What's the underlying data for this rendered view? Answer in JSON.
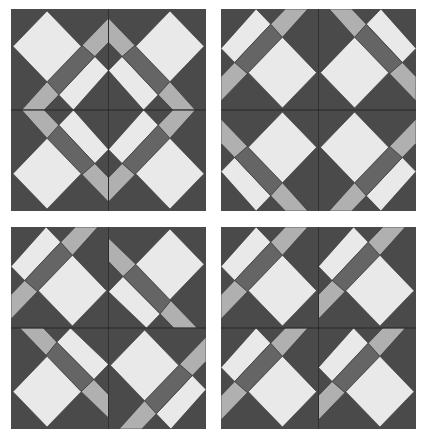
{
  "figure": {
    "colors": {
      "background_dark": "#4a4a4a",
      "stripe_dark": "#656565",
      "medium_gray": "#b0b0b0",
      "light": "#e9e9e9",
      "seam_line": "#1e1e1e"
    },
    "block_shapes": {
      "light_strip": "36,0 51,15 14,53 0,39",
      "dark_stripe": "51,15 63,28 27,64 14,53",
      "medium_top": "51,15 66,0 89,0 63,28",
      "medium_left": "14,53 27,64 0,91 0,67",
      "large_diamond": "63,28 98,63 63,98 28,63"
    },
    "panels": [
      {
        "name": "panel-top-left",
        "quadrants": [
          "rotate-180",
          "flip-vertical",
          "flip-horizontal",
          "base"
        ]
      },
      {
        "name": "panel-top-right",
        "quadrants": [
          "base",
          "flip-horizontal",
          "flip-vertical",
          "rotate-180"
        ]
      },
      {
        "name": "panel-bottom-left",
        "quadrants": [
          "base",
          "rotate-ccw-90",
          "rotate-cw-90",
          "rotate-180"
        ]
      },
      {
        "name": "panel-bottom-right",
        "quadrants": [
          "base",
          "base",
          "base",
          "base"
        ]
      }
    ]
  }
}
